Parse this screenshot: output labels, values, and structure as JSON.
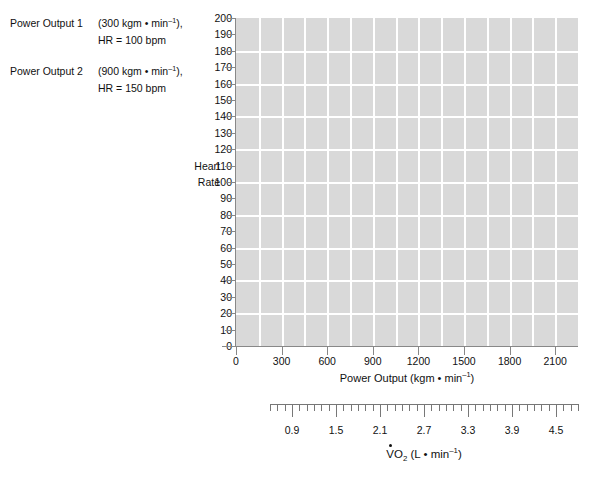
{
  "legend": {
    "rows": [
      {
        "label": "Power Output 1",
        "value_prefix": "(300 kgm • min",
        "value_sup": "–1",
        "value_suffix": "),",
        "sub": "HR = 100 bpm"
      },
      {
        "label": "Power Output 2",
        "value_prefix": "(900 kgm • min",
        "value_sup": "–1",
        "value_suffix": "),",
        "sub": "HR = 150 bpm"
      }
    ]
  },
  "axes": {
    "y_title_line1": "Heart",
    "y_title_line2": "Rate",
    "x_title_prefix": "Power Output (kgm • min",
    "x_title_sup": "–1",
    "x_title_suffix": ")",
    "vo2_title_v": "V",
    "vo2_title_o": "O",
    "vo2_title_sub": "2",
    "vo2_title_rest_prefix": " (L • min",
    "vo2_title_sup": "–1",
    "vo2_title_suffix": ")"
  },
  "chart_data": {
    "type": "scatter",
    "title": "",
    "xlabel": "Power Output (kgm • min–1)",
    "ylabel": "Heart Rate",
    "xlim": [
      0,
      2250
    ],
    "ylim": [
      0,
      200
    ],
    "grid": true,
    "legend_position": "left-outside",
    "series": [],
    "x_ticks": [
      0,
      300,
      600,
      900,
      1200,
      1500,
      1800,
      2100
    ],
    "x_tick_labels": [
      "0",
      "300",
      "600",
      "900",
      "1200",
      "1500",
      "1800",
      "2100"
    ],
    "x_gridline_step": 150,
    "y_ticks": [
      0,
      10,
      20,
      30,
      40,
      50,
      60,
      70,
      80,
      90,
      100,
      110,
      120,
      130,
      140,
      150,
      160,
      170,
      180,
      190,
      200
    ],
    "y_tick_labels": [
      "0",
      "10",
      "20",
      "30",
      "40",
      "50",
      "60",
      "70",
      "80",
      "90",
      "100",
      "110",
      "120",
      "130",
      "140",
      "150",
      "160",
      "170",
      "180",
      "190",
      "200"
    ],
    "y_gridline_step": 20,
    "secondary_axis": {
      "name": "VO2",
      "label": "VO2 (L • min–1)",
      "unit": "L • min–1",
      "range": [
        0.6,
        4.8
      ],
      "minor_tick_step": 0.1,
      "major_ticks": [
        0.9,
        1.5,
        2.1,
        2.7,
        3.3,
        3.9,
        4.5
      ],
      "major_tick_labels": [
        "0.9",
        "1.5",
        "2.1",
        "2.7",
        "3.3",
        "3.9",
        "4.5"
      ]
    },
    "annotations": [
      "Power Output 1 (300 kgm • min–1), HR = 100 bpm",
      "Power Output 2 (900 kgm • min–1), HR = 150 bpm"
    ]
  },
  "colors": {
    "plot_background": "#d9d9d9",
    "gridline": "#ffffff",
    "axis": "#888888",
    "text": "#111111",
    "page_background": "#ffffff"
  }
}
